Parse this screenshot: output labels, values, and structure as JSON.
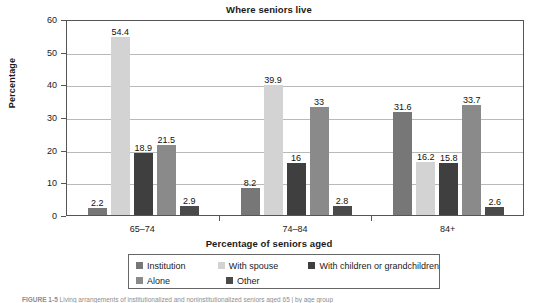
{
  "chart_data": {
    "type": "bar",
    "title": "Where seniors live",
    "xlabel": "Percentage of seniors aged",
    "ylabel": "Percentage",
    "ylim": [
      0,
      60
    ],
    "ytick_step": 10,
    "yticks": [
      "60",
      "50",
      "40",
      "30",
      "20",
      "10",
      "0"
    ],
    "grid": true,
    "grid_axis": "y",
    "legend_position": "bottom",
    "categories": [
      "65–74",
      "74–84",
      "84+"
    ],
    "series": [
      {
        "name": "Institution",
        "color": "#777777",
        "values": [
          2.2,
          8.2,
          31.6
        ]
      },
      {
        "name": "With spouse",
        "color": "#d3d3d3",
        "values": [
          54.4,
          39.9,
          16.2
        ]
      },
      {
        "name": "With children or grandchildren",
        "color": "#3f3f3f",
        "values": [
          18.9,
          16.0,
          15.8
        ]
      },
      {
        "name": "Alone",
        "color": "#8a8a8a",
        "values": [
          21.5,
          33.0,
          33.7
        ]
      },
      {
        "name": "Other",
        "color": "#4a4a4a",
        "values": [
          2.9,
          2.8,
          2.6
        ]
      }
    ],
    "value_labels": [
      [
        "2.2",
        "54.4",
        "18.9",
        "21.5",
        "2.9"
      ],
      [
        "8.2",
        "39.9",
        "16",
        "33",
        "2.8"
      ],
      [
        "31.6",
        "16.2",
        "15.8",
        "33.7",
        "2.6"
      ]
    ]
  },
  "legend": {
    "items": [
      {
        "label": "Institution"
      },
      {
        "label": "With spouse"
      },
      {
        "label": "With children or grandchildren"
      },
      {
        "label": "Alone"
      },
      {
        "label": "Other"
      }
    ]
  },
  "caption": {
    "prefix": "FIGURE 1-5",
    "text": "Living arrangements of institutionalized and noninstitutionalized seniors aged 65 | by age group"
  }
}
